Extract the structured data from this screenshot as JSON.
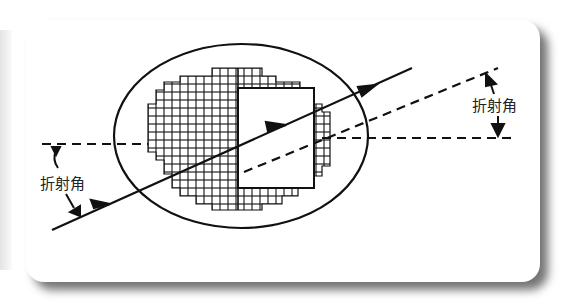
{
  "diagram": {
    "labels": {
      "incident_angle": "折射角",
      "refracted_angle": "折射角"
    },
    "icons": [
      "arrow-head-icon"
    ],
    "colors": {
      "line": "#111111",
      "card": "#ffffff",
      "shadow": "#555555"
    }
  }
}
